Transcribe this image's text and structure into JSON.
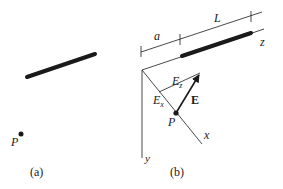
{
  "figure": {
    "panel_a": {
      "caption": "(a)",
      "point_label": "P",
      "elements": [
        "line-charge-rod",
        "point-P"
      ]
    },
    "panel_b": {
      "caption": "(b)",
      "dimension_labels": {
        "a": "a",
        "L": "L"
      },
      "axis_labels": {
        "x": "x",
        "y": "y",
        "z": "z"
      },
      "vector_labels": {
        "E": "E",
        "Ex": "E",
        "Ex_sub": "x",
        "Ez": "E",
        "Ez_sub": "z"
      },
      "point_label": "P"
    }
  },
  "colors": {
    "ink": "#1a1a1a",
    "background": "#ffffff"
  }
}
